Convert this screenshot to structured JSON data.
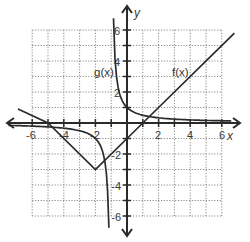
{
  "chart_data": {
    "type": "line",
    "title": "",
    "xlabel": "x",
    "ylabel": "y",
    "xlim": [
      -6,
      6
    ],
    "ylim": [
      -6,
      6
    ],
    "grid": true,
    "x_tick_labels": [
      "-6",
      "-4",
      "-2",
      "2",
      "4",
      "6"
    ],
    "y_tick_labels": [
      "6",
      "4",
      "2",
      "-2",
      "-4",
      "-6"
    ],
    "series": [
      {
        "name": "f(x)",
        "description": "absolute value function, vertex (-2, -3)",
        "x": [
          -6.9,
          -5,
          -2,
          1,
          6.8
        ],
        "y": [
          0.9,
          0,
          -3,
          0,
          5.8
        ]
      },
      {
        "name": "g(x)",
        "description": "reciprocal function with vertical asymptote x = -1 and horizontal asymptote y = 0",
        "branches": [
          {
            "x": [
              -6.8,
              -5,
              -4,
              -3,
              -2,
              -1.5,
              -1.25,
              -1.15
            ],
            "y": [
              -0.17,
              -0.25,
              -0.33,
              -0.5,
              -1,
              -2,
              -4,
              -6.7
            ]
          },
          {
            "x": [
              -0.85,
              -0.75,
              -0.5,
              0,
              1,
              2,
              4,
              6.6
            ],
            "y": [
              6.7,
              4,
              2,
              1,
              0.5,
              0.33,
              0.2,
              0.13
            ]
          }
        ]
      }
    ],
    "annotations": [
      {
        "text": "g(x)",
        "x": -1.6,
        "y": 3.6
      },
      {
        "text": "f(x)",
        "x": 3.6,
        "y": 3.6
      }
    ]
  },
  "labels": {
    "x_axis": "x",
    "y_axis": "y",
    "f_label": "f(x)",
    "g_label": "g(x)",
    "x_ticks": [
      "-6",
      "-4",
      "-2",
      "2",
      "4",
      "6"
    ],
    "y_ticks": [
      "6",
      "4",
      "2",
      "-2",
      "-4",
      "-6"
    ]
  }
}
